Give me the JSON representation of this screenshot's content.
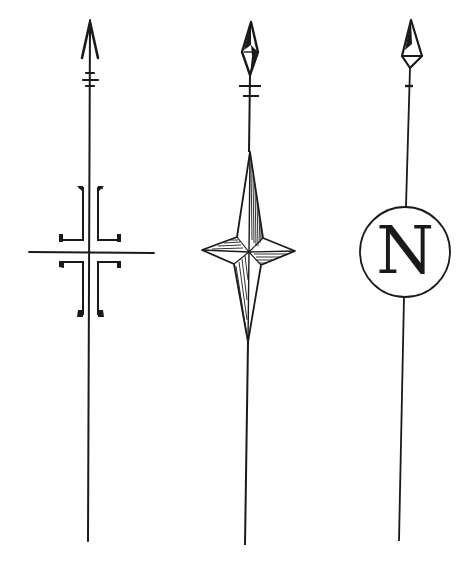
{
  "figure": {
    "stroke_color": "#1a1a1a",
    "background": "#ffffff",
    "arrows": [
      {
        "id": "crossed-brackets",
        "style": "arrowhead with cross and bracket ornament"
      },
      {
        "id": "four-point-star",
        "style": "diamond head with shaded four-point star"
      },
      {
        "id": "n-circle",
        "style": "diamond head with circled N",
        "letter": "N"
      }
    ]
  }
}
